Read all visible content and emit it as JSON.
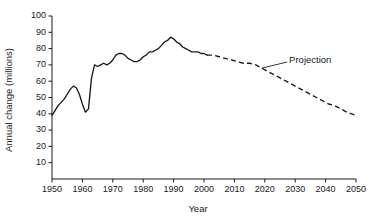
{
  "chart_data": {
    "type": "line",
    "title": "",
    "xlabel": "Year",
    "ylabel": "Annual change (millions)",
    "xlim": [
      1950,
      2050
    ],
    "ylim": [
      0,
      100
    ],
    "grid": false,
    "legend": "none",
    "xticks": [
      1950,
      1960,
      1970,
      1980,
      1990,
      2000,
      2010,
      2020,
      2030,
      2040,
      2050
    ],
    "xtick_labels": [
      "1950",
      "1960",
      "1970",
      "1980",
      "1990",
      "2000",
      "2010",
      "2020",
      "2030",
      "2040",
      "2050"
    ],
    "yticks": [
      10,
      20,
      30,
      40,
      50,
      60,
      70,
      80,
      90,
      100
    ],
    "ytick_labels": [
      "10",
      "20",
      "30",
      "40",
      "50",
      "60",
      "70",
      "80",
      "90",
      "100"
    ],
    "annotations": [
      {
        "text": "Projection",
        "x": 2028,
        "y": 73,
        "leader_to_x": 2019,
        "leader_to_y": 68
      }
    ],
    "series": [
      {
        "name": "Historical annual change",
        "style": "solid",
        "x": [
          1950,
          1951,
          1952,
          1953,
          1954,
          1955,
          1956,
          1957,
          1958,
          1959,
          1960,
          1961,
          1962,
          1963,
          1964,
          1965,
          1966,
          1967,
          1968,
          1969,
          1970,
          1971,
          1972,
          1973,
          1974,
          1975,
          1976,
          1977,
          1978,
          1979,
          1980,
          1981,
          1982,
          1983,
          1984,
          1985,
          1986,
          1987,
          1988,
          1989,
          1990,
          1991,
          1992,
          1993,
          1994,
          1995,
          1996,
          1997,
          1998,
          1999,
          2000,
          2001
        ],
        "y": [
          39,
          42,
          45,
          47,
          49,
          52,
          55,
          57,
          56,
          52,
          46,
          41,
          43,
          62,
          70,
          69,
          70,
          71,
          70,
          71,
          73,
          76,
          77,
          77,
          76,
          74,
          73,
          72,
          72,
          73,
          75,
          76,
          78,
          78,
          79,
          80,
          82,
          84,
          85,
          87,
          86,
          84,
          83,
          81,
          80,
          79,
          78,
          78,
          78,
          77,
          77,
          76
        ]
      },
      {
        "name": "Projected annual change",
        "style": "dashed",
        "x": [
          2001,
          2003,
          2005,
          2007,
          2009,
          2011,
          2013,
          2015,
          2017,
          2019,
          2021,
          2023,
          2025,
          2027,
          2029,
          2031,
          2033,
          2035,
          2037,
          2039,
          2041,
          2043,
          2045,
          2047,
          2050
        ],
        "y": [
          76,
          76,
          75,
          74,
          73,
          72,
          71,
          71,
          70,
          68,
          66,
          64,
          62,
          60,
          58,
          56,
          54,
          52,
          50,
          48,
          46,
          45,
          43,
          41,
          39
        ]
      }
    ]
  }
}
